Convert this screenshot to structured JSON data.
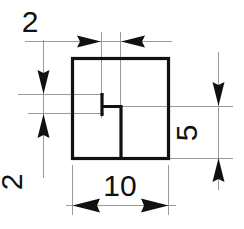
{
  "drawing": {
    "type": "engineering-dimension-drawing",
    "title": "Square profile with internal notch",
    "units": "mm",
    "colors": {
      "outline": "#111111",
      "dimension_line": "#9a9a9a",
      "extension_line": "#9a9a9a",
      "arrow": "#111111",
      "text": "#111111",
      "background": "#ffffff"
    },
    "profile": {
      "name": "square-outline",
      "width": 10,
      "height": 10,
      "feature": {
        "name": "internal-notch",
        "description": "step / notch inside the square formed by a short vertical segment, a horizontal segment to the right, and a vertical segment down to the bottom edge"
      }
    },
    "dimensions": [
      {
        "id": "top-width-2",
        "label": "2",
        "value": 2,
        "orientation": "horizontal",
        "placement": "top",
        "arrow_style": "outside",
        "measures": "offset from notch vertical to centre"
      },
      {
        "id": "left-height-2",
        "label": "2",
        "value": 2,
        "orientation": "vertical",
        "placement": "left",
        "arrow_style": "outside",
        "measures": "height of notch vertical segment"
      },
      {
        "id": "right-height-5",
        "label": "5",
        "value": 5,
        "orientation": "vertical",
        "placement": "right",
        "arrow_style": "outside",
        "measures": "distance from notch horizontal to bottom edge"
      },
      {
        "id": "bottom-width-10",
        "label": "10",
        "value": 10,
        "orientation": "horizontal",
        "placement": "bottom",
        "arrow_style": "outside",
        "measures": "overall width of square"
      }
    ],
    "labels": {
      "top_2": "2",
      "left_2": "2",
      "right_5": "5",
      "bottom_10": "10"
    }
  }
}
